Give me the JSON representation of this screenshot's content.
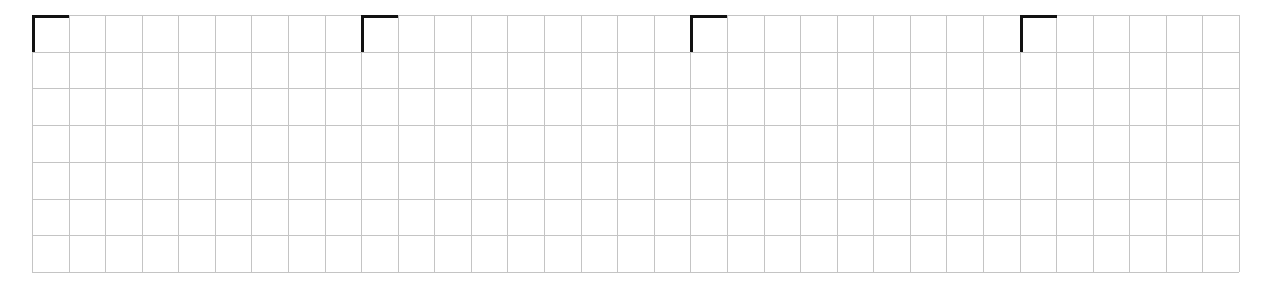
{
  "grid": {
    "columns": 33,
    "rows": 7,
    "origin_x": 32,
    "origin_y": 15,
    "width": 1207,
    "height": 257,
    "line_color": "#c4c4c4"
  },
  "markers": {
    "color": "#111111",
    "column_indices": [
      0,
      9,
      18,
      27
    ]
  }
}
